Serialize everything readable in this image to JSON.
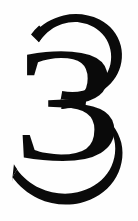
{
  "page": {
    "width_px": 138,
    "height_px": 221,
    "background_color": "#ffffff",
    "paper_tone_color": "#fefefe",
    "kind": "scanned-numeral-glyph"
  },
  "glyph": {
    "character": "3",
    "name": "numeral-three",
    "ink_color": "#0a0a0a",
    "style": "modern-serif-high-contrast",
    "stroke_contrast": "high",
    "bounds": {
      "left_px": 12,
      "top_px": 14,
      "right_px": 123,
      "bottom_px": 194
    },
    "features": {
      "upper_left_terminal": "sheared-open",
      "lower_left_terminal": "tapered-thin",
      "waist_x_px": 63,
      "waist_y_px": 104,
      "top_stroke_thickness_px": 8,
      "right_stroke_thickness_px": 14,
      "bottom_stroke_thickness_px": 9
    }
  }
}
